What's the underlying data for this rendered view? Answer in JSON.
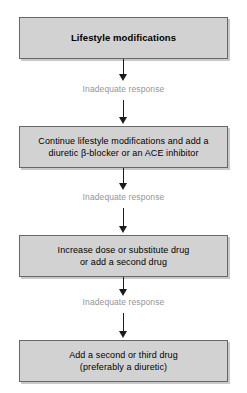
{
  "diagram": {
    "background_color": "#ffffff",
    "box_fill_color": "#d2d2d2",
    "box_border_color": "#676767",
    "label_color": "#959595",
    "arrow_color": "#1b1b1b",
    "steps": [
      {
        "id": "lifestyle",
        "emphasis": "bold",
        "lines": [
          "Lifestyle modifications"
        ]
      },
      {
        "id": "continue",
        "emphasis": "normal",
        "lines": [
          "Continue lifestyle modifications and add a",
          "diuretic β-blocker or an ACE inhibitor"
        ]
      },
      {
        "id": "increase",
        "emphasis": "normal",
        "lines": [
          "Increase dose or substitute drug",
          "or add a second drug"
        ]
      },
      {
        "id": "add-drug",
        "emphasis": "normal",
        "lines": [
          "Add a second or third drug",
          "(preferably a diuretic)"
        ]
      }
    ],
    "connectors": [
      {
        "id": "connector-1",
        "label": "Inadequate response"
      },
      {
        "id": "connector-2",
        "label": "Inadequate response"
      },
      {
        "id": "connector-3",
        "label": "Inadequate response"
      }
    ]
  }
}
